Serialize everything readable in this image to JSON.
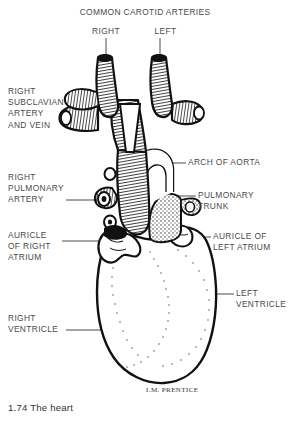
{
  "figure": {
    "caption": "1.74 The heart",
    "signature": "I.M. PRENTICE",
    "ink_color": "#111111",
    "label_color": "#4a4a4a",
    "background": "#ffffff"
  },
  "labels": {
    "common_carotid_arteries": "COMMON CAROTID ARTERIES",
    "carotid_right": "RIGHT",
    "carotid_left": "LEFT",
    "right_subclavian": "RIGHT\nSUBCLAVIAN\nARTERY\nAND VEIN",
    "right_pulmonary_artery": "RIGHT\nPULMONARY\nARTERY",
    "auricle_right_atrium": "AURICLE\nOF RIGHT\nATRIUM",
    "right_ventricle": "RIGHT\nVENTRICLE",
    "arch_of_aorta": "ARCH OF AORTA",
    "pulmonary_trunk": "PULMONARY\nTRUNK",
    "auricle_left_atrium": "AURICLE OF\nLEFT ATRIUM",
    "left_ventricle": "LEFT\nVENTRICLE"
  }
}
